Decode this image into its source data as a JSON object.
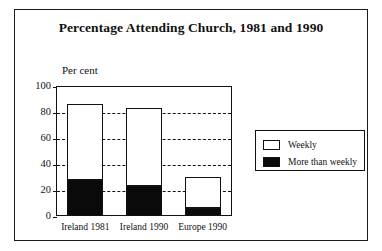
{
  "figure": {
    "title": "Percentage Attending Church, 1981 and 1990",
    "axis_caption": "Per cent"
  },
  "legend": {
    "items": [
      {
        "label": "Weekly",
        "swatch": "white-swatch",
        "color": "#ffffff"
      },
      {
        "label": "More than weekly",
        "swatch": "black-swatch",
        "color": "#0a0a0a"
      }
    ]
  },
  "chart_data": {
    "type": "bar",
    "stacked": true,
    "title": "Percentage Attending Church, 1981 and 1990",
    "xlabel": "",
    "ylabel": "Per cent",
    "ylim": [
      0,
      100
    ],
    "yticks": [
      0,
      20,
      40,
      60,
      80,
      100
    ],
    "ytick_labels": [
      "0",
      "20",
      "40",
      "60",
      "80",
      "100"
    ],
    "grid": true,
    "grid_style": "dashed-horizontal",
    "legend_position": "right",
    "categories": [
      "Ireland 1981",
      "Ireland 1990",
      "Europe 1990"
    ],
    "series": [
      {
        "name": "More than weekly",
        "values": [
          28,
          23,
          6
        ],
        "color": "#0a0a0a"
      },
      {
        "name": "Weekly",
        "values": [
          58,
          60,
          24
        ],
        "color": "#ffffff"
      }
    ],
    "totals": [
      86,
      83,
      30
    ]
  }
}
